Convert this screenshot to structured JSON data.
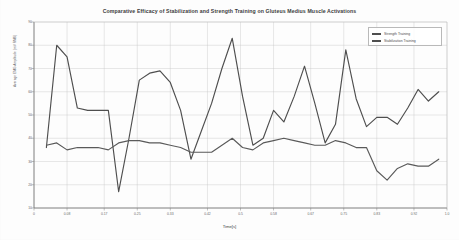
{
  "chart_data": {
    "type": "line",
    "title": "Comparative Efficacy of Stabilization and Strength Training on Gluteus Medius Muscle Activations",
    "xlabel": "Time[s]",
    "ylabel": "Average EMG Amplitude (mV RMS)",
    "xlim": [
      0.0,
      1.0
    ],
    "ylim": [
      10,
      90
    ],
    "grid": true,
    "legend_position": "top-right",
    "yticks": [
      10,
      20,
      30,
      40,
      50,
      60,
      70,
      80,
      90
    ],
    "ytick_labels": [
      "10",
      "20",
      "30",
      "40",
      "50",
      "60",
      "70",
      "80",
      "90"
    ],
    "xticks": [
      0.0,
      0.08,
      0.17,
      0.25,
      0.33,
      0.42,
      0.5,
      0.58,
      0.67,
      0.75,
      0.83,
      0.92,
      1.0
    ],
    "xtick_labels": [
      "0",
      "0.08",
      "0.17",
      "0.25",
      "0.33",
      "0.42",
      "0.5",
      "0.58",
      "0.67",
      "0.75",
      "0.83",
      "0.92",
      "1.0"
    ],
    "x": [
      0.03,
      0.055,
      0.08,
      0.105,
      0.13,
      0.155,
      0.18,
      0.205,
      0.23,
      0.255,
      0.28,
      0.305,
      0.33,
      0.355,
      0.38,
      0.405,
      0.43,
      0.455,
      0.48,
      0.505,
      0.53,
      0.555,
      0.58,
      0.605,
      0.63,
      0.655,
      0.68,
      0.705,
      0.73,
      0.755,
      0.78,
      0.805,
      0.83,
      0.855,
      0.88,
      0.905,
      0.93,
      0.955,
      0.98
    ],
    "series": [
      {
        "name": "Strength Training",
        "color": "#4e4e4e",
        "values": [
          36,
          80,
          75,
          53,
          52,
          52,
          52,
          17,
          40,
          65,
          68,
          69,
          64,
          52,
          31,
          43,
          55,
          70,
          83,
          58,
          37,
          40,
          52,
          47,
          58,
          71,
          55,
          38,
          46,
          78,
          57,
          45,
          49,
          49,
          46,
          53,
          61,
          56,
          60
        ]
      },
      {
        "name": "Stabilization Training",
        "color": "#5a5a5a",
        "values": [
          37,
          38,
          35,
          36,
          36,
          36,
          35,
          38,
          39,
          39,
          38,
          38,
          37,
          36,
          34,
          34,
          34,
          37,
          40,
          36,
          35,
          38,
          39,
          40,
          39,
          38,
          37,
          37,
          39,
          38,
          36,
          36,
          26,
          22,
          27,
          29,
          28,
          28,
          31
        ]
      }
    ]
  },
  "legend": {
    "items": [
      {
        "label": "Strength Training"
      },
      {
        "label": "Stabilization Training"
      }
    ]
  }
}
